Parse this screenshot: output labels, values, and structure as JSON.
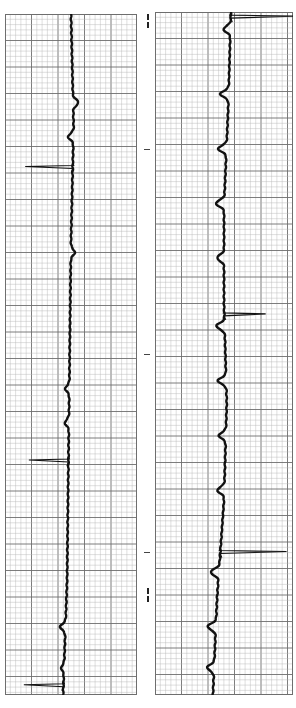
{
  "chart_data": {
    "type": "line",
    "title": "",
    "xlabel": "",
    "ylabel": "",
    "grid": true,
    "orientation": "vertical-strips",
    "paper": {
      "minor_line_color": "#b8b8b8",
      "major_line_color": "#6e6e6e",
      "trace_color": "#111111",
      "minor_per_major": 5
    },
    "strips": [
      {
        "name": "strip-left",
        "baseline_fraction": 0.5,
        "beats": [
          {
            "pos": 0.224,
            "type": "spike-left",
            "amp": 0.36
          },
          {
            "pos": 0.655,
            "type": "spike-left",
            "amp": 0.3
          },
          {
            "pos": 0.985,
            "type": "spike-left",
            "amp": 0.3
          }
        ],
        "waves": [
          {
            "pos": 0.13,
            "amp": 0.04
          },
          {
            "pos": 0.18,
            "amp": -0.04
          },
          {
            "pos": 0.35,
            "amp": 0.03
          },
          {
            "pos": 0.55,
            "amp": -0.03
          },
          {
            "pos": 0.6,
            "amp": -0.03
          },
          {
            "pos": 0.9,
            "amp": -0.04
          },
          {
            "pos": 0.96,
            "amp": -0.02
          }
        ],
        "drift": [
          0.5,
          0.52,
          0.5,
          0.49,
          0.48,
          0.47,
          0.44
        ]
      },
      {
        "name": "strip-right",
        "baseline_fraction": 0.5,
        "beats": [
          {
            "pos": 0.006,
            "type": "spike-right",
            "amp": 0.5
          },
          {
            "pos": 0.442,
            "type": "spike-right",
            "amp": 0.3
          },
          {
            "pos": 0.79,
            "type": "spike-right",
            "amp": 0.48
          }
        ],
        "waves": [
          {
            "pos": 0.025,
            "amp": -0.05
          },
          {
            "pos": 0.12,
            "amp": -0.06
          },
          {
            "pos": 0.2,
            "amp": -0.06
          },
          {
            "pos": 0.28,
            "amp": -0.06
          },
          {
            "pos": 0.36,
            "amp": -0.05
          },
          {
            "pos": 0.46,
            "amp": -0.06
          },
          {
            "pos": 0.54,
            "amp": -0.06
          },
          {
            "pos": 0.62,
            "amp": -0.05
          },
          {
            "pos": 0.7,
            "amp": -0.05
          },
          {
            "pos": 0.82,
            "amp": -0.06
          },
          {
            "pos": 0.9,
            "amp": -0.06
          },
          {
            "pos": 0.96,
            "amp": -0.05
          }
        ],
        "drift": [
          0.55,
          0.53,
          0.5,
          0.5,
          0.52,
          0.5,
          0.45,
          0.42
        ]
      }
    ],
    "gap_markers": [
      {
        "pos": 0.02,
        "kind": "double-dash"
      },
      {
        "pos": 0.21,
        "kind": "tick"
      },
      {
        "pos": 0.5,
        "kind": "tick"
      },
      {
        "pos": 0.78,
        "kind": "tick"
      },
      {
        "pos": 0.83,
        "kind": "double-dash"
      }
    ]
  }
}
